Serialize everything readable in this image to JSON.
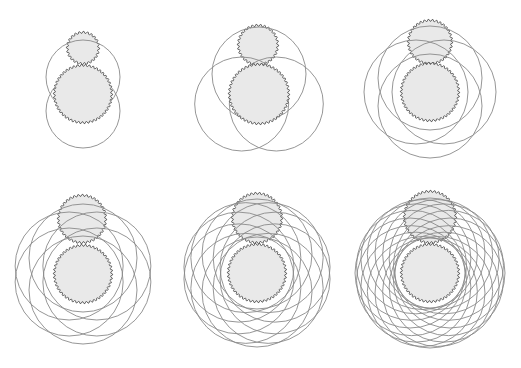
{
  "figure": {
    "colors": {
      "background": "#ffffff",
      "gear_fill": "#e9e9e9",
      "gear_stroke": "#5a5a5a",
      "orbit_stroke": "#8a8a8a"
    },
    "panels": [
      {
        "id": 1,
        "orbit_count": 2,
        "big": {
          "cx": 83,
          "cy": 94,
          "r": 28,
          "teeth": 46
        },
        "small": {
          "cx": 83,
          "cy": 48,
          "r": 15,
          "teeth": 24
        },
        "orbit": {
          "d": 17,
          "r": 37
        }
      },
      {
        "id": 2,
        "orbit_count": 3,
        "big": {
          "cx": 259,
          "cy": 94,
          "r": 29,
          "teeth": 46
        },
        "small": {
          "cx": 258,
          "cy": 45,
          "r": 19,
          "teeth": 30
        },
        "orbit": {
          "d": 20,
          "r": 47
        }
      },
      {
        "id": 3,
        "orbit_count": 4,
        "big": {
          "cx": 430,
          "cy": 92,
          "r": 28,
          "teeth": 46
        },
        "small": {
          "cx": 430,
          "cy": 42,
          "r": 21,
          "teeth": 34
        },
        "orbit": {
          "d": 14,
          "r": 52
        }
      },
      {
        "id": 4,
        "orbit_count": 6,
        "big": {
          "cx": 83,
          "cy": 274,
          "r": 28,
          "teeth": 46
        },
        "small": {
          "cx": 82,
          "cy": 219,
          "r": 23,
          "teeth": 36
        },
        "orbit": {
          "d": 16,
          "r": 54
        }
      },
      {
        "id": 5,
        "orbit_count": 10,
        "big": {
          "cx": 257,
          "cy": 273,
          "r": 28,
          "teeth": 46
        },
        "small": {
          "cx": 257,
          "cy": 218,
          "r": 24,
          "teeth": 38
        },
        "orbit": {
          "d": 19,
          "r": 55
        }
      },
      {
        "id": 6,
        "orbit_count": 16,
        "big": {
          "cx": 430,
          "cy": 273,
          "r": 28,
          "teeth": 46
        },
        "small": {
          "cx": 430,
          "cy": 217,
          "r": 25,
          "teeth": 40
        },
        "orbit": {
          "d": 20,
          "r": 55
        }
      }
    ]
  }
}
